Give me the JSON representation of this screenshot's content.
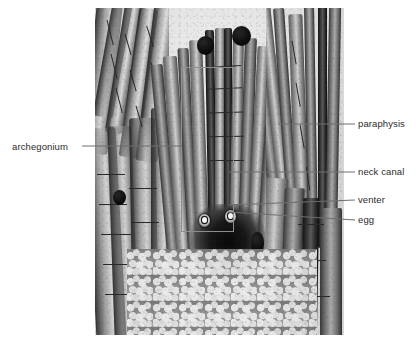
{
  "figure": {
    "type": "annotated-light-micrograph"
  },
  "labels": [
    {
      "id": "archegonium",
      "text": "archegonium",
      "side": "left",
      "text_x": 12,
      "text_y": 141,
      "leader": {
        "x1": 82,
        "y1": 146,
        "x2": 182,
        "y2": 146
      }
    },
    {
      "id": "paraphysis",
      "text": "paraphysis",
      "side": "right",
      "text_x": 358,
      "text_y": 118,
      "leader": {
        "x1": 278,
        "y1": 124,
        "x2": 355,
        "y2": 124
      }
    },
    {
      "id": "neck-canal",
      "text": "neck canal",
      "side": "right",
      "text_x": 358,
      "text_y": 166,
      "leader": {
        "x1": 229,
        "y1": 172,
        "x2": 355,
        "y2": 172
      }
    },
    {
      "id": "venter",
      "text": "venter",
      "side": "right",
      "text_x": 358,
      "text_y": 194,
      "leader": {
        "x1": 228,
        "y1": 205,
        "x2": 355,
        "y2": 200
      }
    },
    {
      "id": "egg",
      "text": "egg",
      "side": "right",
      "text_x": 358,
      "text_y": 214,
      "leader": {
        "x1": 228,
        "y1": 212,
        "x2": 355,
        "y2": 220
      }
    }
  ],
  "callout_box": {
    "x": 181,
    "y": 67,
    "w": 51,
    "h": 163
  },
  "micrograph": {
    "x": 95,
    "y": 8,
    "w": 249,
    "h": 327
  },
  "colors": {
    "background": "#ffffff",
    "leader_line": "#6e6e6e",
    "label_text": "#2b2b2b",
    "callout_border": "#8e8e8a"
  }
}
